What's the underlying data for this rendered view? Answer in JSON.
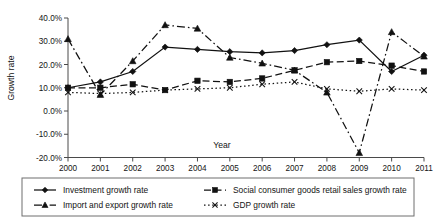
{
  "chart_data": {
    "type": "line",
    "title": "",
    "xlabel": "Year",
    "ylabel": "Growth rate",
    "categories": [
      "2000",
      "2001",
      "2002",
      "2003",
      "2004",
      "2005",
      "2006",
      "2007",
      "2008",
      "2009",
      "2010",
      "2011"
    ],
    "x": [
      2000,
      2001,
      2002,
      2003,
      2004,
      2005,
      2006,
      2007,
      2008,
      2009,
      2010,
      2011
    ],
    "ylim": [
      -20,
      40
    ],
    "ytick_labels": [
      "40.0%",
      "30.0%",
      "20.0%",
      "10.0%",
      "0.0%",
      "-10.0%",
      "-20.0%"
    ],
    "ytick_values": [
      40,
      30,
      20,
      10,
      0,
      -10,
      -20
    ],
    "grid": false,
    "legend_position": "bottom",
    "series": [
      {
        "name": "Investment growth rate",
        "marker": "diamond",
        "line_style": "solid",
        "values": [
          10.0,
          12.5,
          17.0,
          27.5,
          26.5,
          25.5,
          25.0,
          26.0,
          28.5,
          30.5,
          17.0,
          24.0
        ]
      },
      {
        "name": "Social consumer goods retail sales growth rate",
        "marker": "square",
        "line_style": "dashed",
        "values": [
          10.0,
          10.0,
          11.5,
          9.0,
          13.0,
          12.5,
          14.0,
          17.5,
          21.0,
          21.5,
          19.5,
          17.0
        ]
      },
      {
        "name": "Import and export growth rate",
        "marker": "triangle",
        "line_style": "dash-dot",
        "values": [
          31.0,
          7.0,
          21.5,
          37.0,
          35.5,
          23.0,
          20.5,
          17.5,
          8.0,
          -18.0,
          34.0,
          23.5
        ]
      },
      {
        "name": "GDP growth rate",
        "marker": "cross",
        "line_style": "dotted",
        "values": [
          8.0,
          7.5,
          8.0,
          9.0,
          9.5,
          10.0,
          11.5,
          12.5,
          9.5,
          8.5,
          9.5,
          9.0
        ]
      }
    ]
  },
  "legend": {
    "entries": [
      {
        "label": "Investment growth rate"
      },
      {
        "label": "Social consumer goods retail sales growth rate"
      },
      {
        "label": "Import and export growth rate"
      },
      {
        "label": "GDP growth rate"
      }
    ]
  }
}
